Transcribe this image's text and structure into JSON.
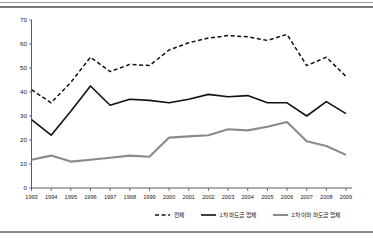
{
  "chart_data": {
    "type": "line",
    "title": "",
    "xlabel": "",
    "ylabel": "",
    "ylim": [
      0,
      70
    ],
    "ytick_step": 10,
    "grid": false,
    "legend_position": "bottom-right",
    "categories": [
      "1993",
      "1994",
      "1995",
      "1996",
      "1997",
      "1998",
      "1999",
      "2000",
      "2001",
      "2002",
      "2003",
      "2004",
      "2005",
      "2006",
      "2007",
      "2008",
      "2009"
    ],
    "yticks": [
      "0",
      "10",
      "20",
      "30",
      "40",
      "50",
      "60",
      "70"
    ],
    "series": [
      {
        "name": "전체",
        "style": "dashed",
        "color": "#111111",
        "values": [
          41.0,
          35.5,
          44.0,
          54.5,
          48.5,
          51.5,
          51.0,
          57.5,
          60.5,
          62.5,
          63.5,
          63.0,
          61.5,
          64.0,
          51.0,
          54.5,
          46.5
        ]
      },
      {
        "name": "1차 하도급 업체",
        "style": "solid",
        "color": "#111111",
        "values": [
          28.5,
          22.0,
          32.0,
          42.5,
          34.5,
          37.0,
          36.5,
          35.5,
          37.0,
          39.0,
          38.0,
          38.5,
          35.5,
          35.5,
          30.0,
          36.0,
          31.0
        ]
      },
      {
        "name": "2차 이하 하도급 업체",
        "style": "solid",
        "color": "#8a8a8a",
        "values": [
          11.8,
          13.5,
          11.0,
          11.8,
          12.6,
          13.5,
          13.0,
          21.0,
          21.5,
          22.0,
          24.5,
          24.0,
          25.5,
          27.5,
          19.5,
          17.5,
          13.8
        ]
      }
    ]
  },
  "legend": {
    "items": [
      {
        "label": "전체"
      },
      {
        "label": "1차 하도급 업체"
      },
      {
        "label": "2차 이하 하도급 업체"
      }
    ]
  }
}
